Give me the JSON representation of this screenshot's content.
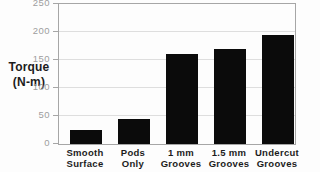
{
  "figure": {
    "y_axis_title_line1": "Torque",
    "y_axis_title_line2": "(N-m)"
  },
  "chart_data": {
    "type": "bar",
    "title": "",
    "xlabel": "",
    "ylabel": "Torque (N-m)",
    "categories": [
      "Smooth Surface",
      "Pods Only",
      "1 mm Grooves",
      "1.5 mm Grooves",
      "Undercut Grooves"
    ],
    "category_label_lines": [
      [
        "Smooth",
        "Surface"
      ],
      [
        "Pods",
        "Only"
      ],
      [
        "1 mm",
        "Grooves"
      ],
      [
        "1.5 mm",
        "Grooves"
      ],
      [
        "Undercut",
        "Grooves"
      ]
    ],
    "values": [
      25,
      45,
      160,
      170,
      195
    ],
    "yticks": [
      0,
      50,
      100,
      150,
      200,
      250
    ],
    "ylim": [
      0,
      250
    ],
    "grid": true,
    "legend": "none",
    "colors": {
      "bar": "#0b0b0b",
      "tick_label": "#9e9e9e",
      "axis_line": "#a6a6a6",
      "grid_line": "#dedede",
      "label_text": "#1c1c1c",
      "background": "#fdfdfd"
    }
  }
}
